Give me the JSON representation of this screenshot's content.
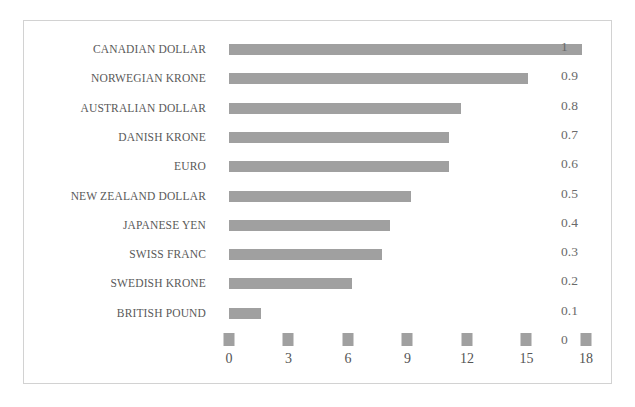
{
  "chart_data": {
    "type": "bar",
    "orientation": "horizontal",
    "title": "",
    "subtitle": "",
    "xlabel": "",
    "ylabel": "",
    "categories": [
      "CANADIAN DOLLAR",
      "NORWEGIAN KRONE",
      "AUSTRALIAN DOLLAR",
      "DANISH KRONE",
      "EURO",
      "NEW ZEALAND DOLLAR",
      "JAPANESE YEN",
      "SWISS FRANC",
      "SWEDISH KRONE",
      "BRITISH POUND"
    ],
    "values": [
      17.8,
      15.1,
      11.7,
      11.1,
      11.1,
      9.2,
      8.1,
      7.7,
      6.2,
      1.6
    ],
    "series": [
      {
        "name": "",
        "values": [
          17.8,
          15.1,
          11.7,
          11.1,
          11.1,
          9.2,
          8.1,
          7.7,
          6.2,
          1.6
        ],
        "color": "#a0a0a0"
      }
    ],
    "xlim": [
      0,
      18
    ],
    "xticks": [
      0,
      3,
      6,
      9,
      12,
      15,
      18
    ],
    "xticklabels": [
      "0",
      "3",
      "6",
      "9",
      "12",
      "15",
      "18"
    ],
    "secondary_axis": {
      "position": "right",
      "ylim": [
        0,
        1
      ],
      "ticks": [
        1,
        0.9,
        0.8,
        0.7,
        0.6,
        0.5,
        0.4,
        0.3,
        0.2,
        0.1,
        0
      ],
      "ticklabels": [
        "1",
        "0.9",
        "0.8",
        "0.7",
        "0.6",
        "0.5",
        "0.4",
        "0.3",
        "0.2",
        "0.1",
        "0"
      ]
    },
    "grid": false,
    "legend": null,
    "legend_position": "none",
    "annotations": [],
    "bar_color": "#a0a0a0",
    "background_color": "#ffffff",
    "border_color": "#d2d2d2",
    "label_color": "#595959",
    "axis_label_color": "#555555"
  }
}
